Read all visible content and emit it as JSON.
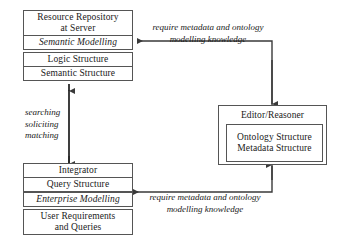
{
  "diagram": {
    "line_color": "#3a3a3a",
    "box_border_color": "#555555",
    "background": "#ffffff"
  },
  "server_cluster": {
    "header": "Resource Repository\nat Server",
    "modelling_layer": "Semantic Modelling",
    "structures": [
      "Logic Structure",
      "Semantic Structure"
    ]
  },
  "client_cluster": {
    "integrator": "Integrator",
    "query_structure": "Query Structure",
    "modelling_layer": "Enterprise Modelling",
    "requirements": "User Requirements\nand Queries"
  },
  "editor_cluster": {
    "header": "Editor/Reasoner",
    "structures": "Ontology Structure\nMetadata Structure"
  },
  "edge_labels": {
    "top_requirement": "require metadata and ontology\nmodelling knowledge",
    "bottom_requirement": "require metadata and ontology\nmodelling knowledge",
    "vertical_flow": "searching\nsoliciting\nmatching"
  }
}
